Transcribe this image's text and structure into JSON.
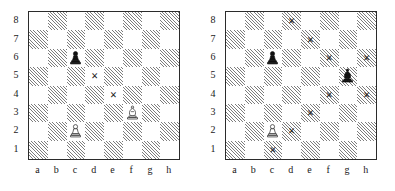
{
  "figure": {
    "type": "chess-diagram-pair",
    "board_size": 8,
    "colors": {
      "light_square": "#ffffff",
      "dark_square_hatch": "#7d7d7d",
      "border": "#2b2b2b",
      "text": "#1a1a1a",
      "mark": "#1c1c1c"
    }
  },
  "labels": {
    "files": [
      "a",
      "b",
      "c",
      "d",
      "e",
      "f",
      "g",
      "h"
    ],
    "ranks": [
      "8",
      "7",
      "6",
      "5",
      "4",
      "3",
      "2",
      "1"
    ]
  },
  "boards": [
    {
      "name": "left-board",
      "pieces": [
        {
          "square": "c6",
          "piece": "pawn",
          "color": "black",
          "icon": "black-pawn-icon"
        },
        {
          "square": "f3",
          "piece": "bishop",
          "color": "white",
          "icon": "white-bishop-icon"
        },
        {
          "square": "c2",
          "piece": "pawn",
          "color": "white",
          "icon": "white-pawn-icon"
        }
      ],
      "marks": [
        {
          "square": "d5",
          "symbol": "×"
        },
        {
          "square": "e4",
          "symbol": "×"
        }
      ]
    },
    {
      "name": "right-board",
      "pieces": [
        {
          "square": "c6",
          "piece": "pawn",
          "color": "black",
          "icon": "black-pawn-icon"
        },
        {
          "square": "g5",
          "piece": "bishop",
          "color": "black",
          "icon": "black-bishop-icon"
        },
        {
          "square": "c2",
          "piece": "pawn",
          "color": "white",
          "icon": "white-pawn-icon"
        }
      ],
      "marks": [
        {
          "square": "d8",
          "symbol": "×"
        },
        {
          "square": "e7",
          "symbol": "×"
        },
        {
          "square": "f6",
          "symbol": "×"
        },
        {
          "square": "h6",
          "symbol": "×"
        },
        {
          "square": "f4",
          "symbol": "×"
        },
        {
          "square": "h4",
          "symbol": "×"
        },
        {
          "square": "e3",
          "symbol": "×"
        },
        {
          "square": "d2",
          "symbol": "×"
        },
        {
          "square": "c1",
          "symbol": "×"
        }
      ]
    }
  ]
}
